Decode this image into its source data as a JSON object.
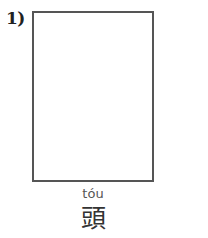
{
  "worksheet": {
    "item_number": "1)",
    "drawing_box": {
      "border_color": "#555555",
      "content": ""
    },
    "pinyin": "tóu",
    "character": "頭"
  }
}
